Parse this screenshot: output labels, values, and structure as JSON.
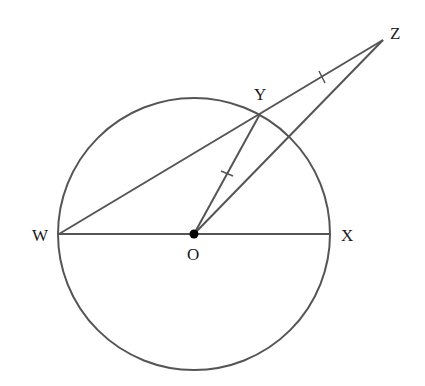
{
  "diagram": {
    "type": "geometry",
    "colors": {
      "stroke": "#555555",
      "text": "#1a1a1a",
      "point": "#000000",
      "background": "#ffffff"
    },
    "circle": {
      "center": "O",
      "cx": 194,
      "cy": 234,
      "r": 136
    },
    "points": {
      "W": {
        "label": "W",
        "x": 59,
        "y": 234
      },
      "X": {
        "label": "X",
        "x": 330,
        "y": 234
      },
      "O": {
        "label": "O",
        "x": 194,
        "y": 234
      },
      "Y": {
        "label": "Y",
        "x": 260,
        "y": 114
      },
      "Z": {
        "label": "Z",
        "x": 383,
        "y": 40
      }
    },
    "segments": [
      {
        "from": "W",
        "to": "X",
        "name": "diameter-WX"
      },
      {
        "from": "W",
        "to": "Z",
        "name": "line-WYZ"
      },
      {
        "from": "O",
        "to": "Y",
        "name": "segment-OY"
      },
      {
        "from": "O",
        "to": "Z",
        "name": "segment-OZ"
      }
    ],
    "equal_marks": [
      "OY",
      "YZ"
    ]
  }
}
